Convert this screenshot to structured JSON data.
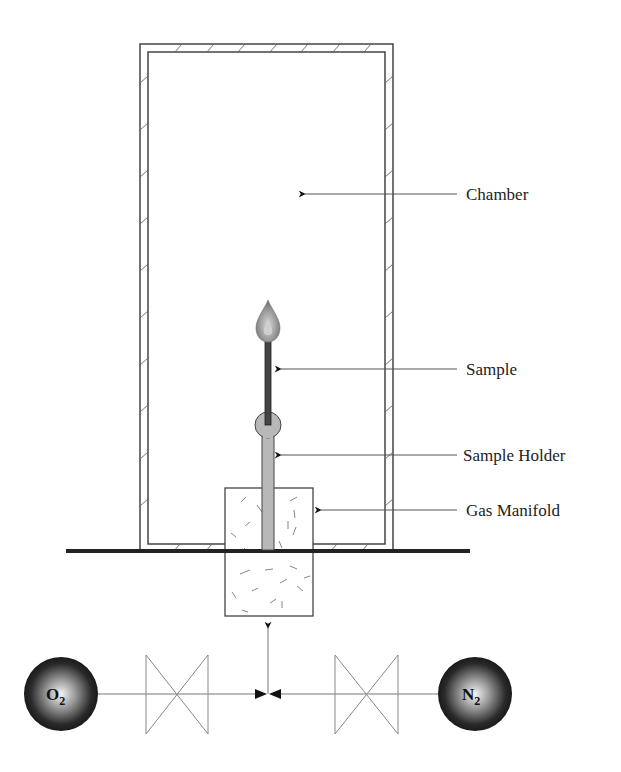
{
  "diagram": {
    "type": "apparatus-schematic",
    "labels": {
      "chamber": "Chamber",
      "sample": "Sample",
      "sample_holder": "Sample Holder",
      "gas_manifold": "Gas Manifold"
    },
    "gas_sources": {
      "left": {
        "symbol": "O",
        "subscript": "2"
      },
      "right": {
        "symbol": "N",
        "subscript": "2"
      }
    },
    "components": [
      "chamber",
      "flame",
      "sample",
      "sample-holder",
      "gas-manifold",
      "base-plate",
      "valve-left",
      "valve-right",
      "mixing-junction",
      "o2-cylinder",
      "n2-cylinder"
    ],
    "colors": {
      "line": "#555555",
      "base_plate": "#222222",
      "holder_fill": "#b8b8b8",
      "sample_fill": "#444444",
      "flame": "#8a8a8a"
    }
  }
}
